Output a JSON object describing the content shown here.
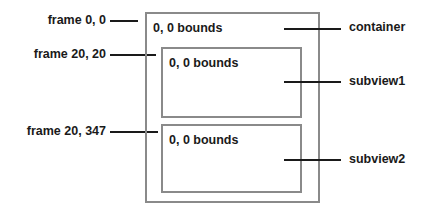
{
  "diagram": {
    "frames": [
      {
        "label": "frame 0, 0",
        "target": "container"
      },
      {
        "label": "frame 20, 20",
        "target": "subview1"
      },
      {
        "label": "frame 20, 347",
        "target": "subview2"
      }
    ],
    "views": {
      "container": {
        "name": "container",
        "bounds_label": "0, 0 bounds"
      },
      "subview1": {
        "name": "subview1",
        "bounds_label": "0, 0 bounds"
      },
      "subview2": {
        "name": "subview2",
        "bounds_label": "0, 0 bounds"
      }
    },
    "colors": {
      "box_border": "#8a8a8a",
      "line": "#1a1a1a",
      "text": "#1a1a1a",
      "background": "#ffffff"
    }
  }
}
